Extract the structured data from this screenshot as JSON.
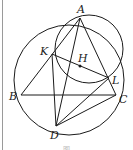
{
  "diagram": {
    "type": "geometry",
    "stroke_color": "#1a1a1a",
    "points": {
      "A": {
        "label": "A",
        "x": 80,
        "y": 18
      },
      "B": {
        "label": "B",
        "x": 21,
        "y": 95
      },
      "C": {
        "label": "C",
        "x": 116,
        "y": 95
      },
      "D": {
        "label": "D",
        "x": 56,
        "y": 126
      },
      "K": {
        "label": "K",
        "x": 52,
        "y": 54
      },
      "L": {
        "label": "L",
        "x": 109,
        "y": 78
      },
      "H": {
        "label": "H",
        "x": 80,
        "y": 66
      }
    },
    "circles": [
      {
        "name": "circumcircle-ABC",
        "cx": 69,
        "cy": 80,
        "r": 55
      },
      {
        "name": "circle-AKL",
        "cx": 89,
        "cy": 49,
        "r": 34
      }
    ],
    "segments": [
      [
        "A",
        "B"
      ],
      [
        "A",
        "C"
      ],
      [
        "B",
        "C"
      ],
      [
        "A",
        "D"
      ],
      [
        "K",
        "D"
      ],
      [
        "K",
        "L"
      ],
      [
        "D",
        "L"
      ],
      [
        "D",
        "C"
      ],
      [
        "A",
        "K"
      ],
      [
        "A",
        "L"
      ]
    ],
    "caption": "图"
  }
}
